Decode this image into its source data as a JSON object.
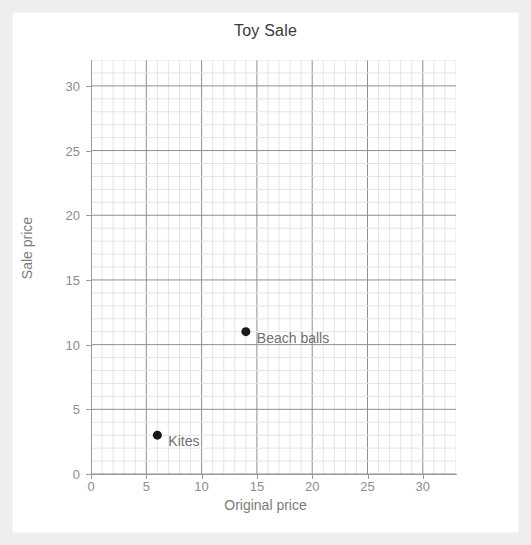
{
  "frame": {
    "border_color": "#eeeeee",
    "background": "#ffffff"
  },
  "chart_data": {
    "type": "scatter",
    "title": "Toy Sale",
    "xlabel": "Original price",
    "ylabel": "Sale price",
    "xlim": [
      0,
      33
    ],
    "ylim": [
      0,
      32
    ],
    "grid": true,
    "grid_minor_step": 1,
    "grid_major_step": 5,
    "grid_minor_color": "#e4e4e4",
    "grid_major_color": "#8f8f8f",
    "legend": "none",
    "point_color": "#1a1a1a",
    "xticks": [
      0,
      5,
      10,
      15,
      20,
      25,
      30
    ],
    "yticks": [
      0,
      5,
      10,
      15,
      20,
      25,
      30
    ],
    "points": [
      {
        "label": "Beach balls",
        "x": 14,
        "y": 11
      },
      {
        "label": "Kites",
        "x": 6,
        "y": 3
      }
    ]
  }
}
